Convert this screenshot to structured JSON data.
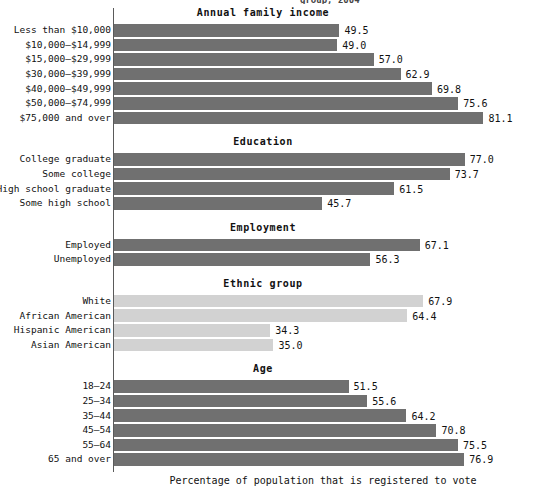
{
  "chart_data": {
    "type": "bar",
    "orientation": "horizontal",
    "title": "",
    "xlabel": "Percentage of population that is registered to vote",
    "ylabel": "",
    "xlim": [
      0,
      85
    ],
    "grid": false,
    "legend": "none",
    "value_label_format": "one-decimal",
    "groups": [
      {
        "name": "Annual family income",
        "shade": "dark",
        "categories": [
          "Less than $10,000",
          "$10,000–$14,999",
          "$15,000–$29,999",
          "$30,000–$39,999",
          "$40,000–$49,999",
          "$50,000–$74,999",
          "$75,000 and over"
        ],
        "values": [
          49.5,
          49.0,
          57.0,
          62.9,
          69.8,
          75.6,
          81.1
        ],
        "value_labels": [
          "49.5",
          "49.0",
          "57.0",
          "62.9",
          "69.8",
          "75.6",
          "81.1"
        ]
      },
      {
        "name": "Education",
        "shade": "dark",
        "categories": [
          "College graduate",
          "Some college",
          "High school graduate",
          "Some high school"
        ],
        "values": [
          77.0,
          73.7,
          61.5,
          45.7
        ],
        "value_labels": [
          "77.0",
          "73.7",
          "61.5",
          "45.7"
        ]
      },
      {
        "name": "Employment",
        "shade": "dark",
        "categories": [
          "Employed",
          "Unemployed"
        ],
        "values": [
          67.1,
          56.3
        ],
        "value_labels": [
          "67.1",
          "56.3"
        ]
      },
      {
        "name": "Ethnic group",
        "shade": "light",
        "categories": [
          "White",
          "African American",
          "Hispanic American",
          "Asian American"
        ],
        "values": [
          67.9,
          64.4,
          34.3,
          35.0
        ],
        "value_labels": [
          "67.9",
          "64.4",
          "34.3",
          "35.0"
        ]
      },
      {
        "name": "Age",
        "shade": "dark",
        "categories": [
          "18–24",
          "25–34",
          "35–44",
          "45–54",
          "55–64",
          "65 and over"
        ],
        "values": [
          51.5,
          55.6,
          64.2,
          70.8,
          75.5,
          76.9
        ],
        "value_labels": [
          "51.5",
          "55.6",
          "64.2",
          "70.8",
          "75.5",
          "76.9"
        ]
      }
    ],
    "colors": {
      "bar_dark": "#707070",
      "bar_light": "#d2d2d2",
      "axis": "#5a5a5a",
      "text": "#111111",
      "background": "#ffffff"
    }
  },
  "sections": {
    "income": {
      "title": "Annual family income"
    },
    "education": {
      "title": "Education"
    },
    "employment": {
      "title": "Employment"
    },
    "ethnic": {
      "title": "Ethnic group"
    },
    "age": {
      "title": "Age"
    }
  },
  "axis": {
    "x_title": "Percentage of population that is registered to vote"
  },
  "clipped_header": {
    "text": "group, 2004"
  }
}
